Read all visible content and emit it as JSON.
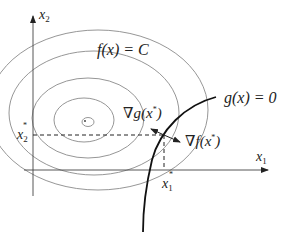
{
  "diagram": {
    "axes": {
      "x_axis_label": "x",
      "x_axis_sub": "1",
      "y_axis_label": "x",
      "y_axis_sub": "2"
    },
    "labels": {
      "level_set": "f(x) = C",
      "constraint": "g(x) = 0",
      "grad_g": "∇g(x",
      "grad_g_close": ")",
      "grad_f": "∇f(x",
      "grad_f_close": ")",
      "star": "*",
      "x1_star": "x",
      "x1_star_sub": "1",
      "x2_star": "x",
      "x2_star_sub": "2"
    },
    "elements": {
      "contours_count": 5,
      "optimum_point": "x*",
      "line_color": "#999999",
      "curve_color": "#111111"
    }
  }
}
